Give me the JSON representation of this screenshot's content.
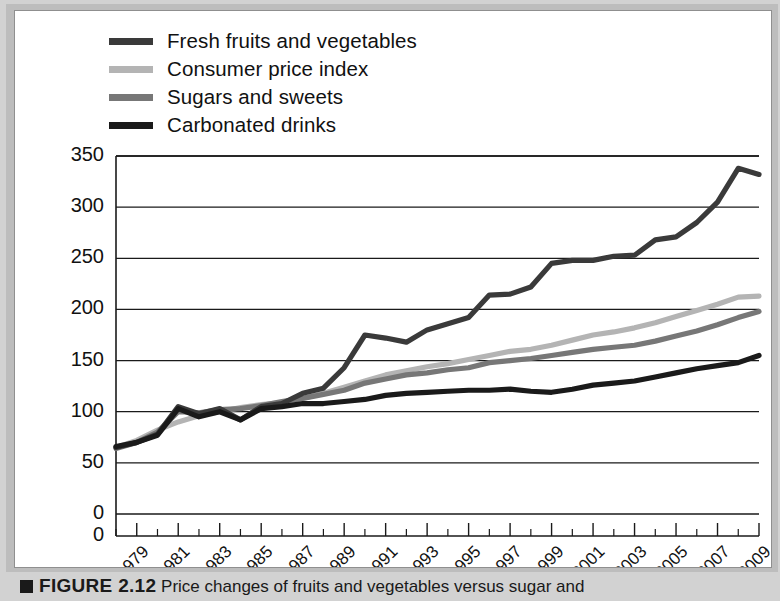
{
  "figure": {
    "caption_marker": "square-marker",
    "caption_label": "FIGURE 2.12",
    "caption_body": "Price changes of fruits and vegetables versus sugar and"
  },
  "legend": {
    "items": [
      {
        "label": "Fresh fruits and vegetables",
        "color": "#3a3a3a"
      },
      {
        "label": "Consumer price index",
        "color": "#b4b4b4"
      },
      {
        "label": "Sugars and sweets",
        "color": "#777777"
      },
      {
        "label": "Carbonated drinks",
        "color": "#1a1a1a"
      }
    ]
  },
  "chart_data": {
    "type": "line",
    "title": "",
    "xlabel": "",
    "ylabel": "Price index (1982–1984=100)",
    "ylim": [
      0,
      350
    ],
    "yticks": [
      0,
      50,
      100,
      150,
      200,
      250,
      300,
      350
    ],
    "xlim": [
      1978,
      2009
    ],
    "xticks": [
      1979,
      1981,
      1983,
      1985,
      1987,
      1989,
      1991,
      1993,
      1995,
      1997,
      1999,
      2001,
      2003,
      2005,
      2007,
      2009
    ],
    "minor_xticks": [
      1978,
      1980,
      1982,
      1984,
      1986,
      1988,
      1990,
      1992,
      1994,
      1996,
      1998,
      2000,
      2002,
      2004,
      2006,
      2008
    ],
    "grid": "horizontal",
    "legend_position": "above-plot",
    "x": [
      1978,
      1979,
      1980,
      1981,
      1982,
      1983,
      1984,
      1985,
      1986,
      1987,
      1988,
      1989,
      1990,
      1991,
      1992,
      1993,
      1994,
      1995,
      1996,
      1997,
      1998,
      1999,
      2000,
      2001,
      2002,
      2003,
      2004,
      2005,
      2006,
      2007,
      2008,
      2009
    ],
    "series": [
      {
        "name": "Fresh fruits and vegetables",
        "color": "#3a3a3a",
        "values": [
          65,
          70,
          78,
          105,
          98,
          103,
          92,
          105,
          108,
          118,
          123,
          143,
          175,
          172,
          168,
          180,
          186,
          192,
          214,
          215,
          222,
          245,
          248,
          248,
          252,
          253,
          268,
          271,
          285,
          305,
          338,
          332
        ]
      },
      {
        "name": "Consumer price index",
        "color": "#b4b4b4",
        "values": [
          65,
          72,
          82,
          90,
          96,
          100,
          104,
          107,
          109,
          113,
          118,
          124,
          130,
          136,
          140,
          144,
          147,
          151,
          155,
          159,
          161,
          165,
          170,
          175,
          178,
          182,
          187,
          193,
          199,
          205,
          212,
          213
        ]
      },
      {
        "name": "Sugars and sweets",
        "color": "#777777",
        "values": [
          64,
          70,
          80,
          100,
          99,
          102,
          103,
          106,
          110,
          113,
          117,
          121,
          128,
          132,
          136,
          138,
          141,
          143,
          148,
          150,
          152,
          155,
          158,
          161,
          163,
          165,
          169,
          174,
          179,
          185,
          192,
          198
        ]
      },
      {
        "name": "Carbonated drinks",
        "color": "#1a1a1a",
        "values": [
          66,
          70,
          77,
          103,
          95,
          100,
          92,
          103,
          105,
          108,
          108,
          110,
          112,
          116,
          118,
          119,
          120,
          121,
          121,
          122,
          120,
          119,
          122,
          126,
          128,
          130,
          134,
          138,
          142,
          145,
          148,
          155
        ]
      }
    ]
  }
}
